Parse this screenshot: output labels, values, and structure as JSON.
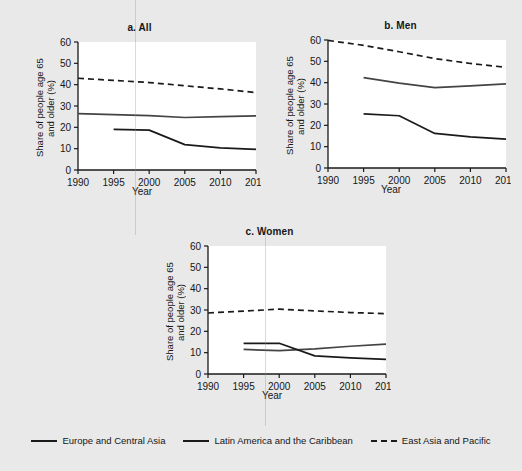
{
  "figure": {
    "background": "#e9e9e9",
    "ink": "#1a1a1a",
    "plot_background": "#ffffff"
  },
  "chart_data": [
    {
      "type": "line",
      "panel_id": "a",
      "title": "a. All",
      "xlabel": "Year",
      "ylabel": "Share of people age 65\nand older (%)",
      "xlim": [
        1990,
        2015
      ],
      "ylim": [
        0,
        60
      ],
      "xticks": [
        1990,
        1995,
        2000,
        2005,
        2010,
        2015
      ],
      "yticks": [
        0,
        10,
        20,
        30,
        40,
        50,
        60
      ],
      "grid": false,
      "legend_position": "bottom-figure",
      "series": [
        {
          "name": "East Asia and Pacific",
          "style": "dashed",
          "color": "#1a1a1a",
          "x": [
            1990,
            1995,
            2000,
            2005,
            2010,
            2015
          ],
          "values": [
            43.0,
            42.0,
            41.0,
            39.5,
            38.0,
            36.3
          ]
        },
        {
          "name": "Europe and Central Asia",
          "style": "solid",
          "color": "#444444",
          "x": [
            1990,
            1995,
            2000,
            2005,
            2010,
            2015
          ],
          "values": [
            26.4,
            26.0,
            25.5,
            24.6,
            25.0,
            25.4
          ]
        },
        {
          "name": "Latin America and the Caribbean",
          "style": "solid",
          "color": "#1a1a1a",
          "x": [
            1995,
            2000,
            2005,
            2010,
            2015
          ],
          "values": [
            19.0,
            18.7,
            11.9,
            10.4,
            9.7
          ]
        }
      ]
    },
    {
      "type": "line",
      "panel_id": "b",
      "title": "b. Men",
      "xlabel": "Year",
      "ylabel": "Share of people age 65\nand older (%)",
      "xlim": [
        1990,
        2015
      ],
      "ylim": [
        0,
        60
      ],
      "xticks": [
        1990,
        1995,
        2000,
        2005,
        2010,
        2015
      ],
      "yticks": [
        0,
        10,
        20,
        30,
        40,
        50,
        60
      ],
      "grid": false,
      "legend_position": "bottom-figure",
      "series": [
        {
          "name": "East Asia and Pacific",
          "style": "dashed",
          "color": "#1a1a1a",
          "x": [
            1990,
            1995,
            2000,
            2005,
            2010,
            2015
          ],
          "values": [
            59.8,
            57.5,
            54.5,
            51.3,
            49.0,
            47.2
          ]
        },
        {
          "name": "Europe and Central Asia",
          "style": "solid",
          "color": "#444444",
          "x": [
            1995,
            2000,
            2005,
            2010,
            2015
          ],
          "values": [
            42.4,
            39.8,
            37.7,
            38.5,
            39.4
          ]
        },
        {
          "name": "Latin America and the Caribbean",
          "style": "solid",
          "color": "#1a1a1a",
          "x": [
            1995,
            2000,
            2005,
            2010,
            2015
          ],
          "values": [
            25.4,
            24.5,
            16.2,
            14.6,
            13.5
          ]
        }
      ]
    },
    {
      "type": "line",
      "panel_id": "c",
      "title": "c. Women",
      "xlabel": "Year",
      "ylabel": "Share of people age 65\nand older (%)",
      "xlim": [
        1990,
        2015
      ],
      "ylim": [
        0,
        60
      ],
      "xticks": [
        1990,
        1995,
        2000,
        2005,
        2010,
        2015
      ],
      "yticks": [
        0,
        10,
        20,
        30,
        40,
        50,
        60
      ],
      "grid": false,
      "legend_position": "bottom-figure",
      "series": [
        {
          "name": "East Asia and Pacific",
          "style": "dashed",
          "color": "#1a1a1a",
          "x": [
            1990,
            1995,
            2000,
            2005,
            2010,
            2015
          ],
          "values": [
            28.6,
            29.5,
            30.4,
            29.6,
            28.8,
            28.3
          ]
        },
        {
          "name": "Europe and Central Asia",
          "style": "solid",
          "color": "#444444",
          "x": [
            1995,
            2000,
            2005,
            2010,
            2015
          ],
          "values": [
            11.5,
            11.0,
            11.8,
            13.0,
            14.0
          ]
        },
        {
          "name": "Latin America and the Caribbean",
          "style": "solid",
          "color": "#1a1a1a",
          "x": [
            1995,
            2000,
            2005,
            2010,
            2015
          ],
          "values": [
            14.4,
            14.4,
            8.5,
            7.6,
            6.9
          ]
        }
      ]
    }
  ],
  "legend": {
    "entries": [
      {
        "label": "Europe and Central Asia",
        "style": "solid"
      },
      {
        "label": "Latin America and the Caribbean",
        "style": "solid"
      },
      {
        "label": "East Asia and Pacific",
        "style": "dashed"
      }
    ]
  }
}
